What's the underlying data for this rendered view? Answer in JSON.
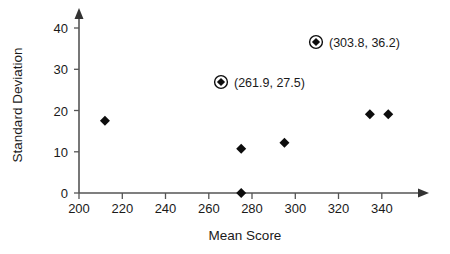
{
  "chart_data": {
    "type": "scatter",
    "title": "",
    "xlabel": "Mean Score",
    "ylabel": "Standard Deviation",
    "xlim": [
      200,
      352
    ],
    "ylim": [
      0,
      44
    ],
    "xticks": [
      200,
      220,
      240,
      260,
      280,
      300,
      320,
      340
    ],
    "yticks": [
      0,
      10,
      20,
      30,
      40
    ],
    "grid": false,
    "legend": false,
    "x": [
      212.0,
      261.9,
      275.0,
      275.0,
      295.0,
      303.8,
      334.5,
      343.0
    ],
    "y": [
      17.5,
      27.5,
      0.0,
      10.7,
      12.2,
      36.2,
      19.1,
      19.1
    ],
    "points": [
      {
        "x": 212.0,
        "y": 17.5,
        "highlighted": false,
        "label": ""
      },
      {
        "x": 275.0,
        "y": 0.0,
        "highlighted": false,
        "label": ""
      },
      {
        "x": 275.0,
        "y": 10.7,
        "highlighted": false,
        "label": ""
      },
      {
        "x": 295.0,
        "y": 12.2,
        "highlighted": false,
        "label": ""
      },
      {
        "x": 334.5,
        "y": 19.1,
        "highlighted": false,
        "label": ""
      },
      {
        "x": 343.0,
        "y": 19.1,
        "highlighted": false,
        "label": ""
      }
    ],
    "annotations": [
      {
        "x": 303.8,
        "y": 36.2,
        "label": "(303.8, 36.2)",
        "highlighted": true
      },
      {
        "x": 261.9,
        "y": 27.5,
        "label": "(261.9, 27.5)",
        "highlighted": true
      }
    ],
    "xtick_labels": [
      "200",
      "220",
      "240",
      "260",
      "280",
      "300",
      "320",
      "340"
    ],
    "ytick_labels": [
      "0",
      "10",
      "20",
      "30",
      "40"
    ],
    "marker_style": "filled-diamond",
    "highlight_style": "circled-filled-diamond",
    "colors": {
      "marker": "#0d0d0d",
      "axis": "#555555",
      "text": "#1a1a1a",
      "background": "#ffffff"
    }
  }
}
